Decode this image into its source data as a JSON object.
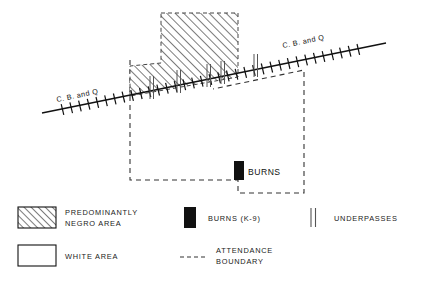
{
  "figure": {
    "type": "map",
    "background_color": "#ffffff",
    "ink_color": "#111111"
  },
  "map": {
    "railroad": {
      "name": "C. B. and Q",
      "label_left": "C. B. and Q",
      "label_right": "C. B. and Q",
      "symbol": "crosshatch-rail-line"
    },
    "school": {
      "label": "BURNS",
      "marker": "black-rectangle"
    },
    "areas": {
      "negro_area_fill": "diagonal-hatch",
      "white_area_fill": "none"
    },
    "underpass_count": 5
  },
  "legend": {
    "items": [
      {
        "symbol": "hatched-box",
        "line1": "PREDOMINANTLY",
        "line2": "NEGRO AREA"
      },
      {
        "symbol": "white-box",
        "line1": "WHITE AREA",
        "line2": ""
      },
      {
        "symbol": "black-box",
        "line1": "BURNS (K-9)",
        "line2": ""
      },
      {
        "symbol": "dashed-line",
        "line1": "ATTENDANCE",
        "line2": "BOUNDARY"
      },
      {
        "symbol": "double-vertical-line",
        "line1": "UNDERPASSES",
        "line2": ""
      }
    ]
  }
}
